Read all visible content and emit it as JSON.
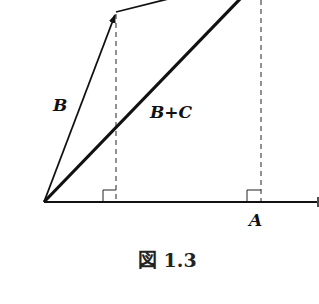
{
  "figure": {
    "caption": "図 1.3",
    "labels": {
      "vector_b": "B",
      "vector_sum": "B+C",
      "vector_a": "A"
    },
    "colors": {
      "stroke": "#111111",
      "background": "#ffffff"
    },
    "elements": [
      {
        "type": "vector",
        "name": "B",
        "from": [
          44,
          202
        ],
        "to": [
          116,
          12
        ],
        "arrow": true
      },
      {
        "type": "vector",
        "name": "C",
        "from": [
          116,
          12
        ],
        "to": [
          170,
          -2
        ],
        "arrow": false,
        "note": "continues beyond top edge"
      },
      {
        "type": "vector",
        "name": "B+C",
        "from": [
          44,
          202
        ],
        "to": [
          240,
          -2
        ],
        "style": "thick"
      },
      {
        "type": "axis",
        "name": "A",
        "from": [
          44,
          202
        ],
        "to": [
          319,
          202
        ],
        "arrow": true
      },
      {
        "type": "dashed",
        "name": "projection-B",
        "x": 116,
        "from_y": 12,
        "to_y": 202
      },
      {
        "type": "dashed",
        "name": "projection-B+C",
        "x": 261,
        "from_y": 0,
        "to_y": 202
      },
      {
        "type": "right-angle",
        "at": [
          116,
          202
        ]
      },
      {
        "type": "right-angle",
        "at": [
          261,
          202
        ]
      }
    ]
  }
}
